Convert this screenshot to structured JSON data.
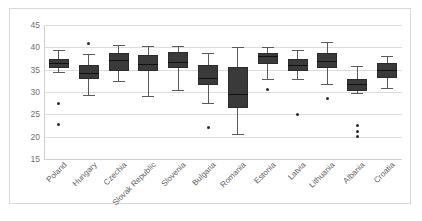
{
  "chart_data": {
    "type": "box",
    "title": "",
    "xlabel": "",
    "ylabel": "",
    "ylim": [
      15,
      45
    ],
    "ytick_labels": [
      "45",
      "40",
      "35",
      "30",
      "25",
      "20",
      "15"
    ],
    "ytick_values": [
      45,
      40,
      35,
      30,
      25,
      20,
      15
    ],
    "grid": true,
    "legend": "none",
    "categories": [
      "Poland",
      "Hungary",
      "Czechia",
      "Slovak Republic",
      "Slovenia",
      "Bulgaria",
      "Romania",
      "Estonia",
      "Latvia",
      "Lithuania",
      "Albania",
      "Croatia"
    ],
    "boxes": [
      {
        "category": "Poland",
        "whisker_low": 34.5,
        "q1": 35.3,
        "median": 36.5,
        "q3": 37.5,
        "whisker_high": 39.5,
        "outliers": [
          27.5,
          22.8
        ]
      },
      {
        "category": "Hungary",
        "whisker_low": 29.4,
        "q1": 33.0,
        "median": 34.3,
        "q3": 36.0,
        "whisker_high": 38.5,
        "outliers": [
          40.8
        ]
      },
      {
        "category": "Czechia",
        "whisker_low": 32.5,
        "q1": 34.7,
        "median": 37.2,
        "q3": 38.7,
        "whisker_high": 40.6,
        "outliers": []
      },
      {
        "category": "Slovak Republic",
        "whisker_low": 29.0,
        "q1": 34.7,
        "median": 36.2,
        "q3": 38.3,
        "whisker_high": 40.3,
        "outliers": []
      },
      {
        "category": "Slovenia",
        "whisker_low": 30.4,
        "q1": 35.4,
        "median": 36.8,
        "q3": 39.0,
        "whisker_high": 40.2,
        "outliers": []
      },
      {
        "category": "Bulgaria",
        "whisker_low": 27.5,
        "q1": 31.6,
        "median": 33.2,
        "q3": 36.0,
        "whisker_high": 38.8,
        "outliers": [
          22.0
        ]
      },
      {
        "category": "Romania",
        "whisker_low": 20.5,
        "q1": 26.5,
        "median": 29.5,
        "q3": 35.5,
        "whisker_high": 40.0,
        "outliers": []
      },
      {
        "category": "Estonia",
        "whisker_low": 33.0,
        "q1": 36.3,
        "median": 38.0,
        "q3": 38.7,
        "whisker_high": 40.0,
        "outliers": [
          30.5
        ]
      },
      {
        "category": "Latvia",
        "whisker_low": 32.8,
        "q1": 34.6,
        "median": 36.0,
        "q3": 37.4,
        "whisker_high": 39.3,
        "outliers": [
          25.0
        ]
      },
      {
        "category": "Lithuania",
        "whisker_low": 31.8,
        "q1": 35.4,
        "median": 37.0,
        "q3": 38.8,
        "whisker_high": 41.2,
        "outliers": [
          28.6
        ]
      },
      {
        "category": "Albania",
        "whisker_low": 29.8,
        "q1": 30.3,
        "median": 31.7,
        "q3": 32.8,
        "whisker_high": 35.8,
        "outliers": [
          22.4,
          21.2,
          20.0
        ]
      },
      {
        "category": "Croatia",
        "whisker_low": 31.0,
        "q1": 33.2,
        "median": 34.9,
        "q3": 36.4,
        "whisker_high": 38.0,
        "outliers": []
      }
    ],
    "colors": {
      "box_fill": "#3a3a3a",
      "box_edge": "#2b2b2b",
      "whisker": "#5a5a5a",
      "median": "#111111",
      "outlier": "#2b2b2b",
      "gridline": "#dcdcdc",
      "frame": "#d9d9d9",
      "tick_text": "#6f6f6f",
      "label_text": "#5d5d5d",
      "background": "#ffffff"
    }
  }
}
